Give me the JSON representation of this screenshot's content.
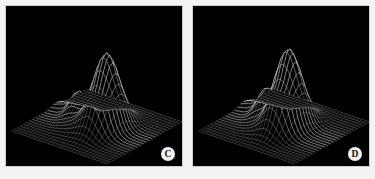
{
  "figure": {
    "background_color": "#f4f3f1",
    "panel_background_color": "#000000",
    "mesh_color": "#ffffff",
    "badge_background_color": "#f3f2ef",
    "badge_text_color": "#111111",
    "panel_count": 2
  },
  "panels": [
    {
      "id": "panel-c",
      "label": "C",
      "badge_name": "panel-label-c"
    },
    {
      "id": "panel-d",
      "label": "D",
      "badge_name": "panel-label-d"
    }
  ],
  "chart_data": [
    {
      "type": "surface",
      "title": "",
      "subtitle": "",
      "xlabel": "",
      "ylabel": "",
      "zlabel": "",
      "panel_label": "C",
      "render_style": "wireframe-mesh",
      "grid": true,
      "legend": "none",
      "line_color": "#ffffff",
      "background": "#000000",
      "grid_nx": 30,
      "grid_ny": 26,
      "xlim": [
        -3.0,
        3.0
      ],
      "ylim": [
        -3.0,
        3.0
      ],
      "zlim": [
        0.0,
        1.0
      ],
      "view": {
        "azimuth": -38,
        "elevation": 26
      },
      "description": "Tall narrow primary peak at right-of-center with a smaller secondary ridge/peak at left, surface falls to near-zero plateau at the far left corner.",
      "peaks": [
        {
          "name": "main-peak",
          "x": 0.55,
          "y": 0.1,
          "amplitude": 1.0,
          "sigma_x": 0.52,
          "sigma_y": 0.85
        },
        {
          "name": "secondary-peak",
          "x": -1.35,
          "y": 0.25,
          "amplitude": 0.33,
          "sigma_x": 0.42,
          "sigma_y": 0.5
        },
        {
          "name": "shoulder",
          "x": -0.35,
          "y": -0.65,
          "amplitude": 0.16,
          "sigma_x": 0.7,
          "sigma_y": 0.7
        },
        {
          "name": "left-tail",
          "x": -2.45,
          "y": 0.55,
          "amplitude": 0.09,
          "sigma_x": 0.5,
          "sigma_y": 0.35
        }
      ]
    },
    {
      "type": "surface",
      "title": "",
      "subtitle": "",
      "xlabel": "",
      "ylabel": "",
      "zlabel": "",
      "panel_label": "D",
      "render_style": "wireframe-mesh",
      "grid": true,
      "legend": "none",
      "line_color": "#ffffff",
      "background": "#000000",
      "grid_nx": 30,
      "grid_ny": 26,
      "xlim": [
        -3.0,
        3.0
      ],
      "ylim": [
        -3.0,
        3.0
      ],
      "zlim": [
        0.0,
        1.0
      ],
      "view": {
        "azimuth": -38,
        "elevation": 26
      },
      "description": "Similar bimodal surface to panel C; main peak is slightly broader and shifted left, secondary ridge is more pronounced and the left plateau extends further.",
      "peaks": [
        {
          "name": "main-peak",
          "x": 0.3,
          "y": 0.05,
          "amplitude": 1.0,
          "sigma_x": 0.5,
          "sigma_y": 0.88
        },
        {
          "name": "secondary-peak",
          "x": -1.25,
          "y": 0.2,
          "amplitude": 0.38,
          "sigma_x": 0.45,
          "sigma_y": 0.52
        },
        {
          "name": "shoulder",
          "x": -0.2,
          "y": -0.7,
          "amplitude": 0.18,
          "sigma_x": 0.72,
          "sigma_y": 0.72
        },
        {
          "name": "left-tail",
          "x": -2.4,
          "y": 0.6,
          "amplitude": 0.11,
          "sigma_x": 0.55,
          "sigma_y": 0.38
        }
      ]
    }
  ]
}
